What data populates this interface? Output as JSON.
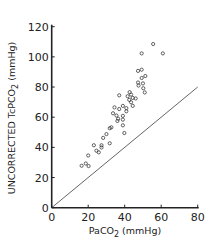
{
  "chart_data": {
    "type": "scatter",
    "title": "",
    "xlabel": "PaCO2 (mmHg)",
    "ylabel": "UNCORRECTED TcPCO2 (mmHg)",
    "xlim": [
      0,
      80
    ],
    "ylim": [
      0,
      120
    ],
    "xticks": [
      0,
      20,
      40,
      60,
      80
    ],
    "yticks": [
      0,
      20,
      40,
      60,
      80,
      100,
      120
    ],
    "grid": false,
    "legend": null,
    "marker": "open-circle",
    "reference_line": {
      "label": "line of identity",
      "x": [
        0,
        80
      ],
      "y": [
        0,
        80
      ]
    },
    "series": [
      {
        "name": "data",
        "points": [
          [
            55.6,
            108.5
          ],
          [
            60.9,
            102.3
          ],
          [
            49.3,
            102.3
          ],
          [
            47.3,
            90.7
          ],
          [
            49.3,
            91.5
          ],
          [
            51.3,
            87.3
          ],
          [
            49.3,
            86.0
          ],
          [
            47.3,
            83.0
          ],
          [
            50.0,
            82.4
          ],
          [
            47.6,
            81.0
          ],
          [
            50.2,
            79.2
          ],
          [
            51.0,
            76.4
          ],
          [
            37.0,
            74.5
          ],
          [
            42.7,
            76.6
          ],
          [
            43.5,
            75.0
          ],
          [
            41.6,
            73.9
          ],
          [
            44.4,
            72.8
          ],
          [
            46.0,
            72.4
          ],
          [
            42.5,
            71.5
          ],
          [
            43.5,
            69.9
          ],
          [
            44.4,
            67.5
          ],
          [
            39.0,
            67.5
          ],
          [
            40.9,
            66.0
          ],
          [
            37.0,
            65.4
          ],
          [
            34.4,
            66.5
          ],
          [
            40.9,
            63.9
          ],
          [
            33.6,
            62.6
          ],
          [
            35.5,
            61.1
          ],
          [
            36.4,
            59.0
          ],
          [
            36.0,
            57.5
          ],
          [
            39.0,
            60.9
          ],
          [
            39.0,
            58.4
          ],
          [
            39.0,
            54.6
          ],
          [
            32.7,
            53.3
          ],
          [
            31.8,
            52.7
          ],
          [
            30.0,
            48.8
          ],
          [
            39.8,
            49.5
          ],
          [
            28.2,
            46.3
          ],
          [
            31.8,
            42.7
          ],
          [
            27.3,
            41.4
          ],
          [
            23.1,
            41.4
          ],
          [
            24.5,
            37.8
          ],
          [
            25.8,
            36.7
          ],
          [
            20.0,
            34.6
          ],
          [
            27.3,
            39.9
          ],
          [
            18.7,
            29.3
          ],
          [
            16.4,
            27.8
          ],
          [
            20.2,
            27.6
          ]
        ]
      }
    ]
  },
  "labels": {
    "xlabel_main": "PaCO",
    "xlabel_sub": "2",
    "xlabel_tail": " (mmHg)",
    "ylabel_main": "UNCORRECTED TcPCO",
    "ylabel_sub": "2",
    "ylabel_tail": " (mmHg)"
  },
  "colors": {
    "ink": "#222222",
    "background": "#ffffff"
  }
}
